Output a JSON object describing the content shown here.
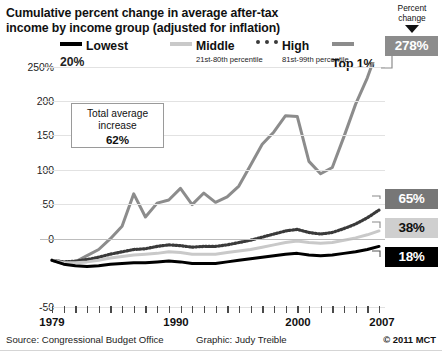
{
  "title": {
    "line1": "Cumulative percent change in average after-tax",
    "line2": "income by income group (adjusted for inflation)"
  },
  "percent_change_caption": {
    "line1": "Percent",
    "line2": "change"
  },
  "legend": [
    {
      "label": "Lowest",
      "sub": "20%",
      "style": "solid-black",
      "color": "#000000"
    },
    {
      "label": "Middle",
      "sub": "21st-80th percentile",
      "style": "solid-lightgray",
      "color": "#c9c9c9"
    },
    {
      "label": "High",
      "sub": "81st-99th percentile",
      "style": "dotted-darkgray",
      "color": "#3a3a3a"
    },
    {
      "label": "Top 1%",
      "sub": "",
      "style": "solid-gray",
      "color": "#8c8c8c"
    }
  ],
  "callout": {
    "line1": "Total average",
    "line2": "increase",
    "value": "62%"
  },
  "end_labels": [
    {
      "name": "top1",
      "value": "278%",
      "bg": "#8c8c8c",
      "fg": "#ffffff"
    },
    {
      "name": "high",
      "value": "65%",
      "bg": "#777777",
      "fg": "#ffffff"
    },
    {
      "name": "middle",
      "value": "38%",
      "bg": "#cfcfcf",
      "fg": "#111111"
    },
    {
      "name": "lowest",
      "value": "18%",
      "bg": "#000000",
      "fg": "#ffffff"
    }
  ],
  "footer": {
    "source": "Source: Congressional Budget Office",
    "graphic": "Graphic: Judy Treible",
    "copyright": "© 2011 MCT"
  },
  "chart_data": {
    "type": "line",
    "title": "Cumulative percent change in average after-tax income by income group (adjusted for inflation)",
    "xlabel": "",
    "ylabel": "Percent change",
    "xlim": [
      1979,
      2007
    ],
    "ylim": [
      -50,
      250
    ],
    "yticks": [
      -50,
      0,
      50,
      100,
      150,
      200,
      250
    ],
    "ytick_labels": [
      "-50",
      "0",
      "50",
      "100",
      "150",
      "200",
      "250%"
    ],
    "xticks": [
      1979,
      1990,
      2000,
      2007
    ],
    "xtick_labels": [
      "1979",
      "1990",
      "2000",
      "2007"
    ],
    "grid": true,
    "legend_position": "top",
    "x": [
      1979,
      1980,
      1981,
      1982,
      1983,
      1984,
      1985,
      1986,
      1987,
      1988,
      1989,
      1990,
      1991,
      1992,
      1993,
      1994,
      1995,
      1996,
      1997,
      1998,
      1999,
      2000,
      2001,
      2002,
      2003,
      2004,
      2005,
      2006,
      2007
    ],
    "series": [
      {
        "name": "Top 1%",
        "color": "#8c8c8c",
        "style": "solid",
        "end_value": 278,
        "values": [
          0,
          -4,
          -2,
          6,
          14,
          28,
          44,
          86,
          56,
          74,
          78,
          93,
          72,
          87,
          75,
          82,
          96,
          123,
          150,
          166,
          187,
          186,
          128,
          112,
          120,
          160,
          202,
          236,
          278
        ]
      },
      {
        "name": "High (81st-99th percentile)",
        "color": "#3a3a3a",
        "style": "dotted",
        "end_value": 65,
        "values": [
          0,
          -2,
          -1,
          1,
          4,
          8,
          11,
          14,
          15,
          18,
          20,
          19,
          17,
          18,
          18,
          20,
          23,
          26,
          30,
          34,
          38,
          40,
          36,
          34,
          36,
          41,
          47,
          55,
          65
        ]
      },
      {
        "name": "Middle (21st-80th percentile)",
        "color": "#c9c9c9",
        "style": "solid",
        "end_value": 38,
        "values": [
          0,
          -3,
          -3,
          -2,
          0,
          3,
          5,
          7,
          8,
          9,
          11,
          10,
          8,
          8,
          8,
          10,
          12,
          14,
          17,
          20,
          23,
          25,
          23,
          22,
          23,
          26,
          29,
          33,
          38
        ]
      },
      {
        "name": "Lowest 20%",
        "color": "#000000",
        "style": "solid",
        "end_value": 18,
        "values": [
          0,
          -5,
          -7,
          -8,
          -7,
          -5,
          -4,
          -3,
          -3,
          -2,
          -1,
          -2,
          -4,
          -4,
          -4,
          -2,
          0,
          2,
          4,
          6,
          8,
          9,
          7,
          6,
          7,
          9,
          11,
          14,
          18
        ]
      }
    ],
    "annotations": [
      {
        "text": "Total average increase 62%",
        "type": "textbox"
      }
    ]
  }
}
